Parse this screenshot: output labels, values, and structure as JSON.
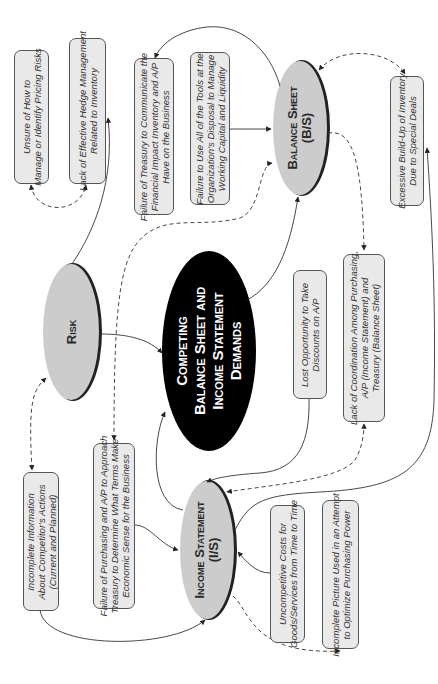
{
  "diagram": {
    "orientation": "rotated-90-ccw",
    "center_node": {
      "label": "Competing\nBalance Sheet and\nIncome Statement\nDemands",
      "fill": "#000000",
      "text_color": "#ffffff"
    },
    "hub_nodes": {
      "risk": {
        "label": "Risk",
        "fill": "#cccccc"
      },
      "balance_sheet": {
        "label": "Balance Sheet\n(B/S)",
        "fill": "#cccccc"
      },
      "income_statement": {
        "label": "Income Statement\n(I/S)",
        "fill": "#cccccc"
      }
    },
    "boxes": {
      "unsure_pricing_risks": "Unsure of How to\nManage or Identify Pricing Risks",
      "lack_hedge_management": "Lack of Effective Hedge Management\nRelated to Inventory",
      "failure_treasury_communicate": "Failure of Treasury to Communicate the\nFinancial Impact Inventory and A/P\nHave on the Business",
      "failure_use_tools": "Failure to Use All of the Tools at the\nOrganization's Disposal to Manage\nWorking Capital and Liquidity",
      "excessive_buildup": "Excessive Build-Up of Inventory\nDue to Special Deals",
      "lost_opportunity": "Lost Opportunity to Take\nDiscounts on A/P",
      "lack_coordination": "Lack of Coordination Among Purchasing,\nA/P (Income Statement) and\nTreasury (Balance Sheet)",
      "incomplete_information": "Incomplete Information\nAbout Competitor's Actions\n(Current and Planned)",
      "failure_purchasing_ap": "Failure of Purchasing and A/P to Approach\nTreasury to Determine What Terms Make\nEconomic Sense for the Business",
      "uncompetitive_costs": "Uncompetitive Costs for\nGoods/Services from Time to Time",
      "incomplete_picture": "Incomplete Picture Used in an Attempt\nto Optimize Purchasing Power"
    },
    "colors": {
      "box_fill": "#e9e9e9",
      "box_border": "#555555",
      "ellipse_fill": "#cccccc",
      "line": "#333333"
    }
  }
}
